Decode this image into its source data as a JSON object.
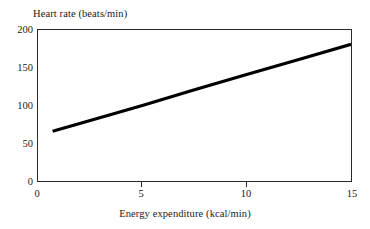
{
  "chart_data": {
    "type": "line",
    "title": "",
    "xlabel": "Energy expenditure (kcal/min)",
    "ylabel": "Heart rate (beats/min)",
    "xlim": [
      0,
      15
    ],
    "ylim": [
      0,
      200
    ],
    "xticks": [
      "0",
      "5",
      "10",
      "15"
    ],
    "xtick_values": [
      0,
      5,
      10,
      15
    ],
    "yticks": [
      "0",
      "50",
      "100",
      "150",
      "200"
    ],
    "ytick_values": [
      0,
      50,
      100,
      150,
      200
    ],
    "grid": false,
    "legend": "none",
    "line_color": "#000000",
    "line_width_px": 3,
    "series": [
      {
        "name": "Heart rate vs energy expenditure",
        "x": [
          0.7,
          15.0
        ],
        "values": [
          66,
          181
        ],
        "points": [
          {
            "x": 0.7,
            "y": 66
          },
          {
            "x": 2.5,
            "y": 80
          },
          {
            "x": 5.0,
            "y": 100
          },
          {
            "x": 7.5,
            "y": 121
          },
          {
            "x": 10.0,
            "y": 141
          },
          {
            "x": 12.5,
            "y": 161
          },
          {
            "x": 15.0,
            "y": 181
          }
        ]
      }
    ]
  },
  "axes": {
    "y_title": "Heart rate (beats/min)",
    "x_title": "Energy expenditure (kcal/min)",
    "y_tick_labels": [
      "200",
      "150",
      "100",
      "50",
      "0"
    ],
    "x_tick_labels": [
      "0",
      "5",
      "10",
      "15"
    ]
  }
}
